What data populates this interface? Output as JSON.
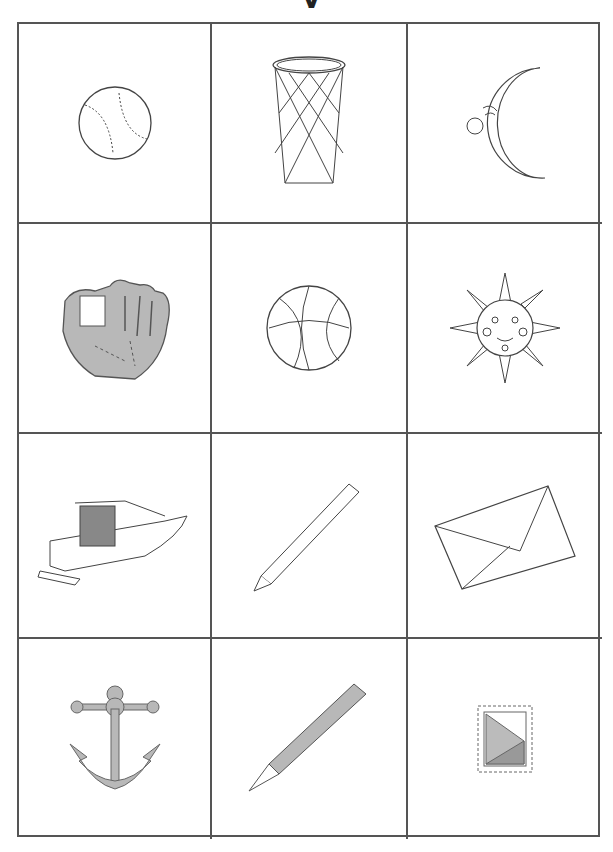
{
  "title_fragment": "y",
  "grid": {
    "rows": 4,
    "columns": 3,
    "cells": [
      {
        "name": "baseball",
        "icon": "baseball-icon"
      },
      {
        "name": "basketball-hoop-net",
        "icon": "basketball-net-icon"
      },
      {
        "name": "crescent-moon",
        "icon": "moon-icon"
      },
      {
        "name": "baseball-glove",
        "icon": "baseball-glove-icon"
      },
      {
        "name": "basketball",
        "icon": "basketball-icon"
      },
      {
        "name": "sun",
        "icon": "sun-icon"
      },
      {
        "name": "boat",
        "icon": "boat-icon"
      },
      {
        "name": "pencil",
        "icon": "pencil-icon"
      },
      {
        "name": "envelope",
        "icon": "envelope-icon"
      },
      {
        "name": "anchor",
        "icon": "anchor-icon"
      },
      {
        "name": "fountain-pen",
        "icon": "fountain-pen-icon"
      },
      {
        "name": "postage-stamp",
        "icon": "stamp-icon"
      }
    ]
  },
  "colors": {
    "line": "#555555",
    "fill_gray": "#b8b8b8",
    "stroke": "#444444"
  }
}
